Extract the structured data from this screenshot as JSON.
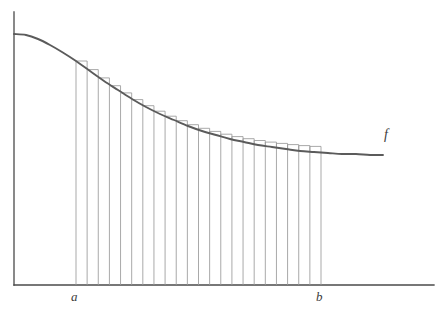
{
  "figure": {
    "kind": "riemann-sum-diagram",
    "title": "",
    "background_color": "#ffffff",
    "width": 441,
    "height": 319
  },
  "labels": {
    "lower_limit": "a",
    "upper_limit": "b",
    "function": "f"
  },
  "colors": {
    "axis": "#4a4a4a",
    "curve": "#5b5b5b",
    "rectangle": "#9a9a9a",
    "text": "#3b3b3b",
    "background": "#ffffff"
  },
  "chart_data": {
    "type": "area",
    "title": "",
    "subtitle": "",
    "xlabel": "",
    "ylabel": "",
    "grid": false,
    "legend_position": "inline-right",
    "annotations": [
      {
        "text": "a",
        "x": 76,
        "y": 285,
        "role": "lower-limit-tick-label"
      },
      {
        "text": "b",
        "x": 321,
        "y": 285,
        "role": "upper-limit-tick-label"
      },
      {
        "text": "f",
        "x": 388,
        "y": 137,
        "role": "curve-label"
      }
    ],
    "axes": {
      "x_axis": {
        "x_start": 14,
        "x_end": 434,
        "y": 285
      },
      "y_axis": {
        "x": 14,
        "y_start": 12,
        "y_end": 285
      }
    },
    "curve": {
      "name": "f",
      "description": "smooth decreasing convex-then-concave curve",
      "x_start": 14,
      "x_end": 383,
      "y_start": 34,
      "y_end": 155,
      "points": [
        [
          14,
          34
        ],
        [
          26,
          35
        ],
        [
          38,
          39
        ],
        [
          50,
          45
        ],
        [
          62,
          52
        ],
        [
          76,
          61
        ],
        [
          90,
          71
        ],
        [
          104,
          81
        ],
        [
          118,
          90
        ],
        [
          132,
          99
        ],
        [
          146,
          107
        ],
        [
          160,
          114
        ],
        [
          174,
          120
        ],
        [
          188,
          126
        ],
        [
          202,
          131
        ],
        [
          216,
          135
        ],
        [
          230,
          139
        ],
        [
          244,
          142
        ],
        [
          258,
          145
        ],
        [
          272,
          147
        ],
        [
          286,
          149
        ],
        [
          300,
          151
        ],
        [
          314,
          152
        ],
        [
          328,
          153
        ],
        [
          342,
          154
        ],
        [
          356,
          154
        ],
        [
          370,
          155
        ],
        [
          383,
          155
        ]
      ]
    },
    "riemann": {
      "rule": "left-endpoint",
      "interval_count": 22,
      "a_x": 76,
      "b_x": 321,
      "baseline_y": 285,
      "partition_x": [
        76,
        87.14,
        98.27,
        109.41,
        120.55,
        131.68,
        142.82,
        153.95,
        165.09,
        176.23,
        187.36,
        198.5,
        209.64,
        220.77,
        231.91,
        243.05,
        254.18,
        265.32,
        276.45,
        287.59,
        298.73,
        309.86,
        321
      ],
      "rect_top_y": [
        61,
        69.6,
        77.9,
        85.7,
        92.9,
        99.6,
        105.7,
        111.2,
        116.2,
        120.7,
        124.7,
        128.3,
        131.4,
        134.2,
        136.6,
        138.7,
        140.5,
        142.1,
        143.4,
        144.6,
        145.6,
        146.4
      ]
    }
  }
}
